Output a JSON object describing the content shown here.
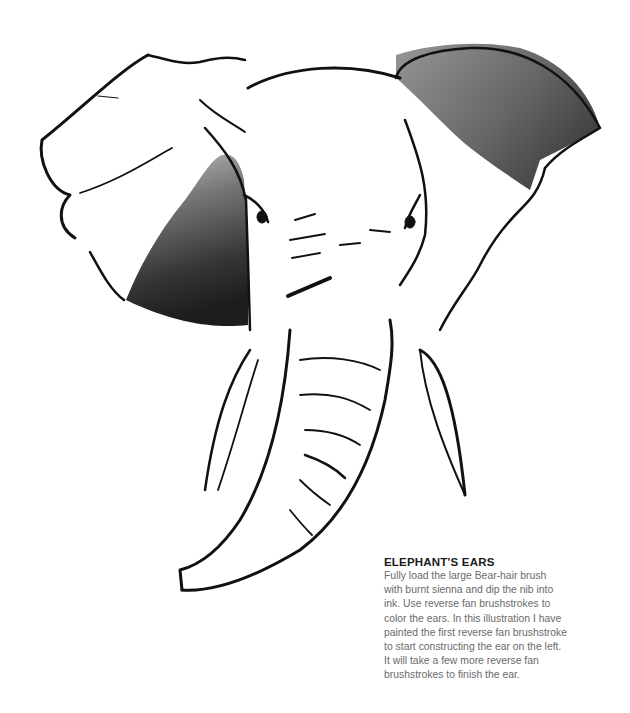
{
  "illustration": {
    "subject": "elephant head ink-brush drawing",
    "ink_color": "#111111",
    "wash_color_dark": "#1c1c1c",
    "wash_color_light": "#7a7a7a"
  },
  "caption": {
    "title": "ELEPHANT'S EARS",
    "lines": [
      "Fully load the large Bear-hair brush",
      "with burnt sienna and dip the nib into",
      "ink. Use reverse fan brushstrokes to",
      "color the ears. In this illustration I have",
      "painted the first reverse fan brushstroke",
      "to start constructing the ear on the left.",
      "It will take a few more reverse fan",
      "brushstrokes to finish the ear."
    ]
  }
}
